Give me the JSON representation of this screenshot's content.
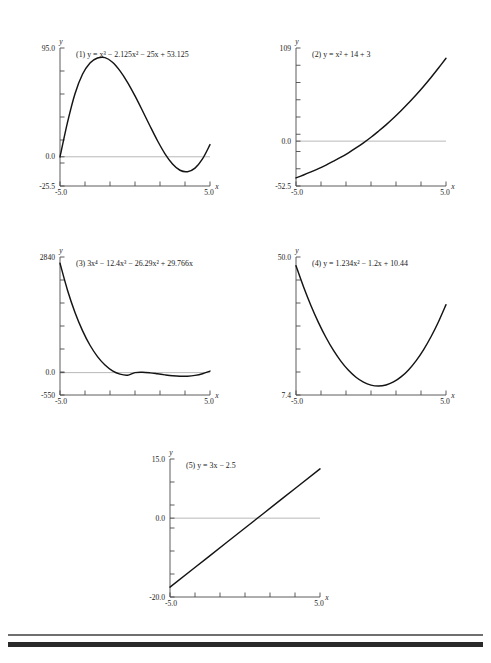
{
  "page": {
    "width": 491,
    "height": 663,
    "background": "#ffffff",
    "curve_color": "#141414",
    "axis_color": "#4a4a4a",
    "zero_line_color": "#9a9a9a"
  },
  "footer_rules": {
    "thin_rule_color": "#6f6f6f",
    "thick_rule_color": "#2a2a2a"
  },
  "chart_data": [
    {
      "id": "plot-1",
      "type": "line",
      "title": "(1) y = x³ − 2.125x² − 25x + 53.125",
      "title_parts": {
        "index": "(1)",
        "lhs": "y",
        "equals": "=",
        "terms": "x³ − 2.125x² − 25x + 53.125"
      },
      "xlabel": "x",
      "ylabel": "y",
      "xlim": [
        -5.0,
        5.0
      ],
      "ylim": [
        -25.5,
        95.0
      ],
      "xtick_labels": [
        "-5.0",
        "5.0"
      ],
      "ytick_labels": [
        "95.0",
        "0.0",
        "-25.5"
      ],
      "ytick_values": [
        95.0,
        0.0,
        -25.5
      ],
      "n_xticks": 6,
      "n_yticks": 6,
      "grid": false,
      "legend": "none",
      "zero_line": true,
      "coefficients": [
        1,
        -2.125,
        -25,
        53.125
      ],
      "points": [
        [
          -5.0,
          -0.125
        ],
        [
          -4.5,
          30.06
        ],
        [
          -4.0,
          55.12
        ],
        [
          -3.5,
          72.06
        ],
        [
          -3.0,
          82.0
        ],
        [
          -2.5,
          86.25
        ],
        [
          -2.0,
          86.62
        ],
        [
          -1.5,
          82.56
        ],
        [
          -1.0,
          75.0
        ],
        [
          -0.5,
          65.0
        ],
        [
          0.0,
          53.12
        ],
        [
          0.5,
          40.2
        ],
        [
          1.0,
          26.87
        ],
        [
          1.5,
          14.0
        ],
        [
          2.0,
          2.62
        ],
        [
          2.5,
          -6.25
        ],
        [
          3.0,
          -11.75
        ],
        [
          3.5,
          -13.0
        ],
        [
          4.0,
          -9.87
        ],
        [
          4.5,
          -1.87
        ],
        [
          5.0,
          10.62
        ]
      ]
    },
    {
      "id": "plot-2",
      "type": "line",
      "title": "(2) y = x² + 14 + 3",
      "title_parts": {
        "index": "(2)",
        "lhs": "y",
        "equals": "=",
        "terms": "x² + 14 + 3"
      },
      "xlabel": "x",
      "ylabel": "y",
      "xlim": [
        -5.0,
        5.0
      ],
      "ylim": [
        -52.5,
        109.0
      ],
      "xtick_labels": [
        "-5.0",
        "5.0"
      ],
      "ytick_labels": [
        "109",
        "0.0",
        "-52.5"
      ],
      "ytick_values": [
        109.0,
        0.0,
        -52.5
      ],
      "n_xticks": 6,
      "n_yticks": 8,
      "grid": false,
      "legend": "none",
      "zero_line": true,
      "points": [
        [
          -5.0,
          -43.0
        ],
        [
          -4.5,
          -39.6
        ],
        [
          -4.0,
          -36.0
        ],
        [
          -3.5,
          -32.2
        ],
        [
          -3.0,
          -28.0
        ],
        [
          -2.5,
          -23.5
        ],
        [
          -2.0,
          -18.8
        ],
        [
          -1.5,
          -13.6
        ],
        [
          -1.0,
          -8.0
        ],
        [
          -0.5,
          -2.0
        ],
        [
          0.0,
          4.5
        ],
        [
          0.5,
          11.6
        ],
        [
          1.0,
          19.0
        ],
        [
          1.5,
          27.0
        ],
        [
          2.0,
          35.5
        ],
        [
          2.5,
          44.6
        ],
        [
          3.0,
          54.0
        ],
        [
          3.5,
          64.0
        ],
        [
          4.0,
          74.5
        ],
        [
          4.5,
          85.6
        ],
        [
          5.0,
          97.0
        ]
      ]
    },
    {
      "id": "plot-3",
      "type": "line",
      "title": "(3) 3x⁴ − 12.4x³ − 26.29x² + 29.766x",
      "title_parts": {
        "index": "(3)",
        "lhs": "",
        "equals": "",
        "terms": "3x⁴ − 12.4x³ − 26.29x² + 29.766x"
      },
      "xlabel": "x",
      "ylabel": "y",
      "xlim": [
        -5.0,
        5.0
      ],
      "ylim": [
        -550.0,
        2840.0
      ],
      "xtick_labels": [
        "-5.0",
        "5.0"
      ],
      "ytick_labels": [
        "2840",
        "0.0",
        "-550"
      ],
      "ytick_values": [
        2840.0,
        0.0,
        -550.0
      ],
      "n_xticks": 6,
      "n_yticks": 6,
      "grid": false,
      "legend": "none",
      "zero_line": true,
      "coefficients": [
        3,
        -12.4,
        -26.29,
        29.766,
        0
      ],
      "points": [
        [
          -5.0,
          2686.0
        ],
        [
          -4.5,
          2025.0
        ],
        [
          -4.0,
          1478.0
        ],
        [
          -3.5,
          1031.0
        ],
        [
          -3.0,
          672.0
        ],
        [
          -2.5,
          393.0
        ],
        [
          -2.0,
          186.0
        ],
        [
          -1.5,
          44.0
        ],
        [
          -1.0,
          -37.0
        ],
        [
          -0.5,
          -63.0
        ],
        [
          0.0,
          0.0
        ],
        [
          0.5,
          8.0
        ],
        [
          1.0,
          -5.9
        ],
        [
          1.5,
          -30.0
        ],
        [
          2.0,
          -56.0
        ],
        [
          2.5,
          -78.0
        ],
        [
          3.0,
          -90.0
        ],
        [
          3.5,
          -88.0
        ],
        [
          4.0,
          -68.0
        ],
        [
          4.5,
          -27.0
        ],
        [
          5.0,
          38.0
        ]
      ]
    },
    {
      "id": "plot-4",
      "type": "line",
      "title": "(4) y = 1.234x² − 1.2x + 10.44",
      "title_parts": {
        "index": "(4)",
        "lhs": "y",
        "equals": "=",
        "terms": "1.234x² − 1.2x + 10.44"
      },
      "xlabel": "x",
      "ylabel": "y",
      "xlim": [
        -5.0,
        5.0
      ],
      "ylim": [
        7.4,
        50.0
      ],
      "xtick_labels": [
        "-5.0",
        "5.0"
      ],
      "ytick_labels": [
        "50.0",
        "7.4"
      ],
      "ytick_values": [
        50.0,
        7.4
      ],
      "n_xticks": 6,
      "n_yticks": 6,
      "grid": false,
      "legend": "none",
      "zero_line": false,
      "coefficients": [
        1.234,
        -1.2,
        10.44
      ],
      "points": [
        [
          -5.0,
          47.29
        ],
        [
          -4.5,
          40.83
        ],
        [
          -4.0,
          34.98
        ],
        [
          -3.5,
          29.76
        ],
        [
          -3.0,
          25.15
        ],
        [
          -2.5,
          21.15
        ],
        [
          -2.0,
          17.78
        ],
        [
          -1.5,
          15.02
        ],
        [
          -1.0,
          12.87
        ],
        [
          -0.5,
          11.35
        ],
        [
          0.0,
          10.44
        ],
        [
          0.5,
          10.15
        ],
        [
          1.0,
          10.47
        ],
        [
          1.5,
          11.42
        ],
        [
          2.0,
          12.98
        ],
        [
          2.5,
          15.15
        ],
        [
          3.0,
          17.95
        ],
        [
          3.5,
          21.36
        ],
        [
          4.0,
          25.38
        ],
        [
          4.5,
          30.03
        ],
        [
          5.0,
          35.29
        ]
      ]
    },
    {
      "id": "plot-5",
      "type": "line",
      "title": "(5) y = 3x − 2.5",
      "title_parts": {
        "index": "(5)",
        "lhs": "y",
        "equals": "=",
        "terms": "3x − 2.5"
      },
      "xlabel": "x",
      "ylabel": "y",
      "xlim": [
        -5.0,
        5.0
      ],
      "ylim": [
        -20.0,
        15.0
      ],
      "xtick_labels": [
        "-5.0",
        "5.0"
      ],
      "ytick_labels": [
        "15.0",
        "0.0",
        "-20.0"
      ],
      "ytick_values": [
        15.0,
        0.0,
        -20.0
      ],
      "n_xticks": 6,
      "n_yticks": 6,
      "grid": false,
      "legend": "none",
      "zero_line": true,
      "coefficients": [
        3,
        -2.5
      ],
      "points": [
        [
          -5.0,
          -17.5
        ],
        [
          -2.5,
          -10.0
        ],
        [
          0.0,
          -2.5
        ],
        [
          2.5,
          5.0
        ],
        [
          5.0,
          12.5
        ]
      ]
    }
  ]
}
